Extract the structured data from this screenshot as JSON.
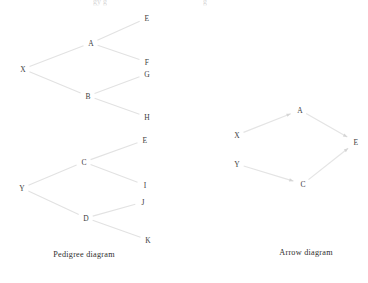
{
  "page": {
    "background_color": "#ffffff",
    "line_color": "#e2e2e2",
    "text_color": "#3c3c3c",
    "width": 368,
    "height": 283
  },
  "clipped_top_text": {
    "fragment_left": "gy  g",
    "fragment_right": "g"
  },
  "figures": [
    {
      "id": "pedigree",
      "caption": "Pedigree diagram",
      "caption_pos": {
        "x": 84,
        "y": 254
      },
      "type": "tree",
      "nodes": [
        {
          "id": "X",
          "label": "X",
          "x": 23,
          "y": 69
        },
        {
          "id": "Y",
          "label": "Y",
          "x": 22,
          "y": 188
        },
        {
          "id": "A",
          "label": "A",
          "x": 91,
          "y": 43
        },
        {
          "id": "B",
          "label": "B",
          "x": 88,
          "y": 96
        },
        {
          "id": "C",
          "label": "C",
          "x": 84,
          "y": 162
        },
        {
          "id": "D",
          "label": "D",
          "x": 86,
          "y": 218
        },
        {
          "id": "E1",
          "label": "E",
          "x": 147,
          "y": 18
        },
        {
          "id": "F1",
          "label": "F",
          "x": 147,
          "y": 62
        },
        {
          "id": "G",
          "label": "G",
          "x": 147,
          "y": 74
        },
        {
          "id": "H",
          "label": "H",
          "x": 147,
          "y": 117
        },
        {
          "id": "E2",
          "label": "E",
          "x": 145,
          "y": 140
        },
        {
          "id": "I",
          "label": "I",
          "x": 145,
          "y": 185
        },
        {
          "id": "J",
          "label": "J",
          "x": 143,
          "y": 202
        },
        {
          "id": "K",
          "label": "K",
          "x": 148,
          "y": 240
        }
      ],
      "edges": [
        {
          "from": "X",
          "to": "A"
        },
        {
          "from": "X",
          "to": "B"
        },
        {
          "from": "A",
          "to": "E1"
        },
        {
          "from": "A",
          "to": "F1"
        },
        {
          "from": "B",
          "to": "G"
        },
        {
          "from": "B",
          "to": "H"
        },
        {
          "from": "Y",
          "to": "C"
        },
        {
          "from": "Y",
          "to": "D"
        },
        {
          "from": "C",
          "to": "E2"
        },
        {
          "from": "C",
          "to": "I"
        },
        {
          "from": "D",
          "to": "J"
        },
        {
          "from": "D",
          "to": "K"
        }
      ]
    },
    {
      "id": "arrow",
      "caption": "Arrow diagram",
      "caption_pos": {
        "x": 306,
        "y": 252
      },
      "type": "directed-graph",
      "nodes": [
        {
          "id": "A",
          "label": "A",
          "x": 300,
          "y": 110
        },
        {
          "id": "X",
          "label": "X",
          "x": 237,
          "y": 135
        },
        {
          "id": "E",
          "label": "E",
          "x": 356,
          "y": 142
        },
        {
          "id": "Y",
          "label": "Y",
          "x": 237,
          "y": 164
        },
        {
          "id": "C",
          "label": "C",
          "x": 303,
          "y": 184
        }
      ],
      "edges": [
        {
          "from": "X",
          "to": "A",
          "directed": true
        },
        {
          "from": "A",
          "to": "E",
          "directed": true
        },
        {
          "from": "Y",
          "to": "C",
          "directed": true
        },
        {
          "from": "C",
          "to": "E",
          "directed": true
        }
      ]
    }
  ]
}
